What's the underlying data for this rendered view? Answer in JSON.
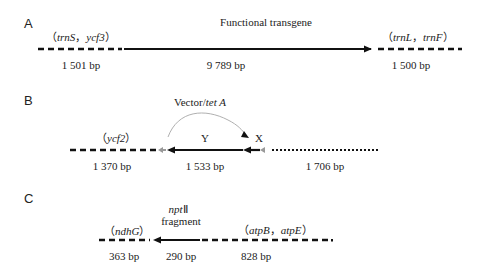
{
  "panels": {
    "A": {
      "letter": "A",
      "left_flank": "（trnS，ycf3）",
      "left_flank_genes": [
        "trnS",
        "ycf3"
      ],
      "insert_label": "Functional transgene",
      "right_flank": "（trnL，trnF）",
      "right_flank_genes": [
        "trnL",
        "trnF"
      ],
      "sizes": [
        "1 501 bp",
        "9 789 bp",
        "1 500 bp"
      ]
    },
    "B": {
      "letter": "B",
      "vector_label_prefix": "Vector/",
      "vector_label_gene": "tet A",
      "left_flank": "（ycf2）",
      "left_flank_gene": "ycf2",
      "marker_y": "Y",
      "marker_x": "X",
      "sizes": [
        "1 370 bp",
        "1 533 bp",
        "1 706 bp"
      ]
    },
    "C": {
      "letter": "C",
      "fragment_gene": "npt",
      "fragment_roman": "Ⅱ",
      "fragment_label": "fragment",
      "left_flank": "（ndhG）",
      "left_flank_gene": "ndhG",
      "right_flank": "（atpB，atpE）",
      "right_flank_genes": [
        "atpB",
        "atpE"
      ],
      "sizes": [
        "363 bp",
        "290 bp",
        "828 bp"
      ]
    }
  },
  "colors": {
    "line": "#111111",
    "marker_gray": "#999999",
    "arc": "#b0b0b0"
  }
}
